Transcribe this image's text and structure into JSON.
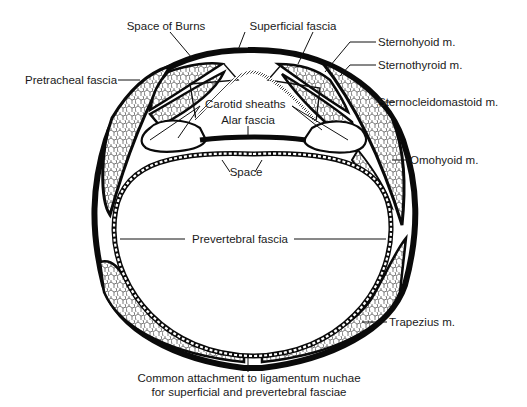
{
  "figure": {
    "colors": {
      "ink": "#0a0a0a",
      "background": "#ffffff",
      "muscle_fill": "#ffffff"
    }
  },
  "labels": {
    "space_of_burns": "Space of Burns",
    "superficial_fascia": "Superficial fascia",
    "sternohyoid": "Sternohyoid m.",
    "sternothyroid": "Sternothyroid m.",
    "pretracheal_fascia": "Pretracheal fascia",
    "carotid_sheaths": "Carotid sheaths",
    "sternocleidomastoid": "Sternocleidomastoid m.",
    "alar_fascia": "Alar fascia",
    "omohyoid": "Omohyoid m.",
    "space": "Space",
    "prevertebral_fascia": "Prevertebral fascia",
    "trapezius": "Trapezius m.",
    "common_attachment_line1": "Common attachment to ligamentum nuchae",
    "common_attachment_line2": "for superficial and prevertebral fasciae"
  }
}
